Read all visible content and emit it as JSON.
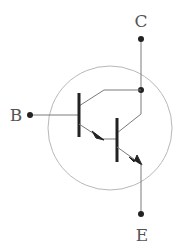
{
  "diagram": {
    "terminals": {
      "collector": {
        "label": "C"
      },
      "base": {
        "label": "B"
      },
      "emitter": {
        "label": "E"
      }
    },
    "colors": {
      "line": "#7a7a7a",
      "bar": "#222222",
      "dot": "#222222",
      "circle": "#b5b5b5",
      "label": "#555555"
    }
  }
}
